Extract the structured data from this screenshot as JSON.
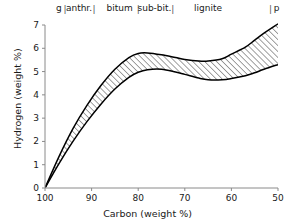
{
  "chart_data": {
    "type": "area",
    "title": "",
    "xlabel": "Carbon (weight %)",
    "ylabel": "Hydrogen (weight %)",
    "xlim": [
      100,
      50
    ],
    "ylim": [
      0,
      7
    ],
    "xticks": [
      100,
      90,
      80,
      70,
      60,
      50
    ],
    "yticks": [
      0,
      1,
      2,
      3,
      4,
      5,
      6,
      7
    ],
    "grid": false,
    "legend": null,
    "band_description": "Hatched envelope of hydrogen vs carbon content across coal ranks",
    "x": [
      100,
      97,
      94,
      91,
      88,
      85,
      82,
      80,
      78,
      75,
      72,
      70,
      67,
      65,
      62,
      60,
      57,
      55,
      53,
      50
    ],
    "series": [
      {
        "name": "upper bound",
        "values": [
          0.0,
          1.35,
          2.55,
          3.55,
          4.4,
          5.1,
          5.6,
          5.78,
          5.8,
          5.72,
          5.6,
          5.52,
          5.45,
          5.45,
          5.55,
          5.75,
          6.05,
          6.35,
          6.65,
          7.05
        ]
      },
      {
        "name": "lower bound",
        "values": [
          0.0,
          1.05,
          2.0,
          2.85,
          3.6,
          4.25,
          4.75,
          4.97,
          5.08,
          5.1,
          4.98,
          4.88,
          4.72,
          4.65,
          4.65,
          4.7,
          4.82,
          4.95,
          5.1,
          5.3
        ]
      }
    ],
    "categories_axis": {
      "position": "top",
      "separator_symbol": "|",
      "items": [
        {
          "label": "g",
          "center_carbon": 97.0
        },
        {
          "label": "anthr.",
          "center_carbon": 92.7
        },
        {
          "label": "bitum",
          "center_carbon": 84.0
        },
        {
          "label": "sub-bit.",
          "center_carbon": 76.5
        },
        {
          "label": "lignite",
          "center_carbon": 65.0
        },
        {
          "label": "p",
          "center_carbon": 50.3
        }
      ],
      "separators_carbon": [
        95.7,
        89.5,
        80.0,
        72.6,
        51.6
      ]
    },
    "colors": {
      "curve": "#000000",
      "hatch": "#222222",
      "axis": "#8a8a8a",
      "text": "#1a1a1a",
      "background": "#ffffff"
    }
  }
}
